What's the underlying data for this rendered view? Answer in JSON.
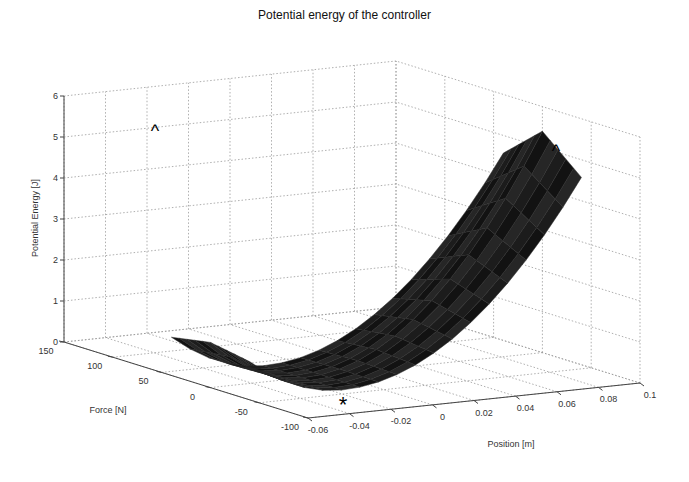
{
  "chart_data": {
    "type": "surface3d",
    "title": "Potential energy of the controller",
    "xlabel": "Position [m]",
    "ylabel": "Force [N]",
    "zlabel": "Potential Energy [J]",
    "x_ticks": [
      "-0.06",
      "-0.04",
      "-0.02",
      "0",
      "0.02",
      "0.04",
      "0.06",
      "0.08",
      "0.1"
    ],
    "y_ticks": [
      "150",
      "100",
      "50",
      "0",
      "-50",
      "-100"
    ],
    "z_ticks": [
      "0",
      "1",
      "2",
      "3",
      "4",
      "5",
      "6"
    ],
    "xlim": [
      -0.06,
      0.1
    ],
    "ylim": [
      -100,
      150
    ],
    "zlim": [
      0,
      6
    ],
    "grid": true,
    "surface_color": "#111111",
    "surface_corners": [
      {
        "label": "left peak",
        "position": -0.06,
        "force": 0,
        "energy": 5.3
      },
      {
        "label": "right peak",
        "position": 0.1,
        "force": 0,
        "energy": 4.9
      },
      {
        "label": "front minimum",
        "position": -0.02,
        "force": -30,
        "energy": 0.0
      },
      {
        "label": "center saddle",
        "position": 0.0,
        "force": 40,
        "energy": 0.3
      }
    ],
    "annotations": [
      {
        "marker": "^",
        "description": "left peak marker",
        "position": -0.055,
        "energy": 5.5
      },
      {
        "marker": "^",
        "description": "right peak marker",
        "position": 0.09,
        "energy": 5.0
      },
      {
        "marker": "*",
        "description": "minimum marker",
        "position": -0.03,
        "energy": 0.0
      }
    ]
  },
  "labels": {
    "title": "Potential energy of the controller",
    "xlabel": "Position [m]",
    "ylabel": "Force [N]",
    "zlabel": "Potential Energy [J]",
    "marker_peak": "^",
    "marker_min": "*"
  }
}
